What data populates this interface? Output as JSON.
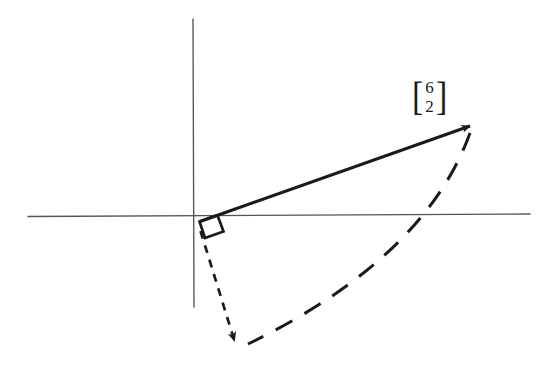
{
  "figure": {
    "background_color": "#ffffff",
    "ink_color": "#1a1a1a",
    "axis_color": "#4a4a4a",
    "width": 538,
    "height": 366
  },
  "labels": {
    "vector_label": {
      "open_bracket": "[",
      "close_bracket": "]",
      "component_x": "6",
      "component_y": "2"
    }
  },
  "chart_data": {
    "type": "scatter",
    "xlabel": "",
    "ylabel": "",
    "grid": false,
    "legend": "none",
    "axes": {
      "origin_px": [
        199,
        222
      ],
      "x_axis_px": {
        "x1": 28,
        "y1": 216,
        "x2": 530,
        "y2": 214
      },
      "y_axis_px": {
        "x1": 193,
        "y1": 19,
        "x2": 194,
        "y2": 307
      },
      "units_per_px_x": 0.0216,
      "units_per_px_y": 0.0216
    },
    "vectors": [
      {
        "name": "original-vector",
        "label": "[6 2]",
        "components": [
          6,
          2
        ],
        "style": "solid",
        "arrow": true,
        "start_px": [
          199,
          222
        ],
        "end_px": [
          477,
          122
        ]
      },
      {
        "name": "rotated-vector",
        "label": "",
        "components": [
          2,
          -6
        ],
        "style": "short-dashed",
        "arrow": true,
        "start_px": [
          199,
          227
        ],
        "end_px": [
          236,
          350
        ]
      }
    ],
    "arcs": [
      {
        "name": "rotation-arc",
        "style": "long-dashed",
        "arrow": false,
        "start_px": [
          470,
          132
        ],
        "end_px": [
          247,
          345
        ],
        "control_px": [
          418,
          300
        ],
        "description": "90 degree clockwise rotation sweep"
      }
    ],
    "annotations": [
      {
        "name": "right-angle-marker",
        "type": "right-angle-square",
        "at_px": [
          199,
          222
        ],
        "description": "square marker indicating 90 degrees between the two vectors"
      }
    ]
  }
}
